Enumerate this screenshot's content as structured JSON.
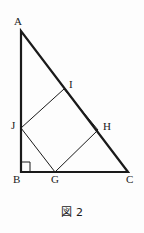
{
  "figure": {
    "caption": "図 2",
    "type": "geometry-diagram",
    "stroke_color": "#1a1a1a",
    "outer_stroke_width": 2.2,
    "inner_stroke_width": 1.0,
    "background_color": "#fdfdfd",
    "canvas": {
      "width": 144,
      "height": 233
    },
    "points": {
      "A": {
        "x": 21,
        "y": 31,
        "label": "A",
        "label_x": 14,
        "label_y": 16
      },
      "B": {
        "x": 21,
        "y": 172,
        "label": "B",
        "label_x": 13,
        "label_y": 174
      },
      "C": {
        "x": 128,
        "y": 172,
        "label": "C",
        "label_x": 126,
        "label_y": 174
      },
      "G": {
        "x": 55,
        "y": 172,
        "label": "G",
        "label_x": 51,
        "label_y": 174
      },
      "H": {
        "x": 98,
        "y": 130,
        "label": "H",
        "label_x": 103,
        "label_y": 121
      },
      "I": {
        "x": 64,
        "y": 89,
        "label": "I",
        "label_x": 69,
        "label_y": 79
      },
      "J": {
        "x": 21,
        "y": 128,
        "label": "J",
        "label_x": 11,
        "label_y": 120
      }
    },
    "outer_triangle": {
      "name": "triangle-ABC",
      "vertices": [
        "A",
        "B",
        "C"
      ],
      "path": "M21,31 L21,172 L128,172 Z"
    },
    "inner_square": {
      "name": "square-JIHG",
      "vertices": [
        "J",
        "I",
        "H",
        "G"
      ],
      "path": "M21,128 L64,89 L98,130 L55,172 Z"
    },
    "right_angle_marker": {
      "at": "B",
      "path": "M21,162 L30,162 L30,172",
      "size": 9
    }
  }
}
